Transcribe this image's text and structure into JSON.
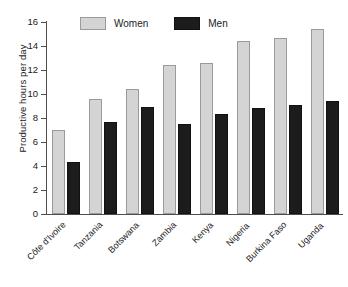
{
  "chart_data": {
    "type": "bar",
    "title": "",
    "xlabel": "",
    "ylabel": "Productive hours per day",
    "ylim": [
      0,
      16
    ],
    "yticks": [
      0,
      2,
      4,
      6,
      8,
      10,
      12,
      14,
      16
    ],
    "ytick_labels": [
      "0",
      "2",
      "4",
      "6",
      "8",
      "10",
      "12",
      "14",
      "16"
    ],
    "grid": false,
    "legend_position": "top-center",
    "categories": [
      "Côte d'Ivoire",
      "Tanzania",
      "Botswana",
      "Zambia",
      "Kenya",
      "Nigeria",
      "Burkina Faso",
      "Uganda"
    ],
    "series": [
      {
        "name": "Women",
        "color": "#d4d4d4",
        "values": [
          7.0,
          9.6,
          10.4,
          12.4,
          12.6,
          14.4,
          14.7,
          15.4
        ]
      },
      {
        "name": "Men",
        "color": "#1c1c1c",
        "values": [
          4.3,
          7.7,
          8.9,
          7.5,
          8.3,
          8.8,
          9.1,
          9.4
        ]
      }
    ]
  },
  "legend": {
    "items": [
      {
        "label": "Women",
        "swatch": "women-swatch"
      },
      {
        "label": "Men",
        "swatch": "men-swatch"
      }
    ]
  }
}
